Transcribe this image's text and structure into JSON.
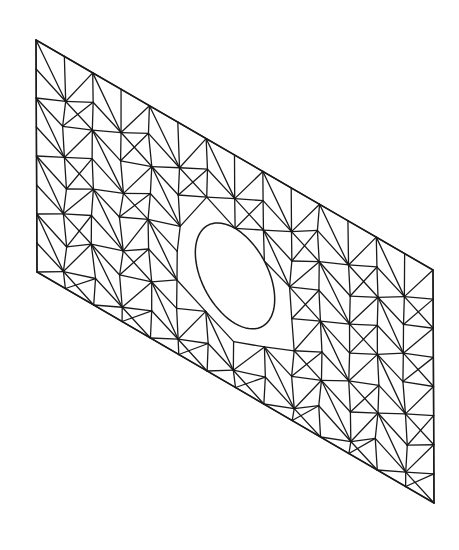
{
  "figure": {
    "kind": "finite-element triangular mesh of a skewed plate with elliptical hole",
    "background_color": "#ffffff",
    "line_color": "#1a1a1a",
    "line_width": 1.3
  },
  "plate": {
    "corners": {
      "top_left": [
        36,
        40
      ],
      "top_right": [
        433,
        270
      ],
      "bottom_right": [
        434,
        503
      ],
      "bottom_left": [
        37,
        272
      ]
    },
    "columns": 14,
    "rows": 8
  },
  "hole": {
    "center": [
      235,
      272
    ],
    "local_center_uv": [
      0.5,
      0.52
    ],
    "local_radius_u": 0.1,
    "local_radius_v": 0.205
  }
}
